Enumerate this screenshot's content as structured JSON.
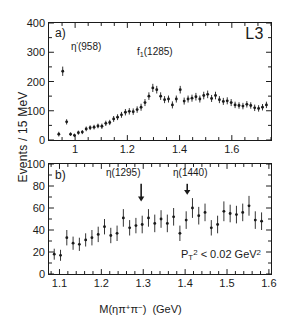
{
  "figure": {
    "experiment": "L3",
    "axis_y_label": "Events / 15 MeV",
    "axis_x_label": "M(ηπ+π−)  (GeV)"
  },
  "panel_a": {
    "tag": "a)",
    "peak_labels": [
      {
        "name": "eta-prime-958",
        "text": "η'(958)"
      },
      {
        "name": "f1-1285",
        "text": "f₁(1285)"
      }
    ]
  },
  "panel_b": {
    "tag": "b)",
    "cut_text": "P T 2 < 0.02 GeV 2",
    "arrow_labels": [
      {
        "name": "eta-1295",
        "text": "η(1295)",
        "x": 1.295
      },
      {
        "name": "eta-1440",
        "text": "η(1440)",
        "x": 1.405
      }
    ]
  },
  "chart_data": [
    {
      "type": "scatter",
      "panel": "a",
      "title": "Events / 15 MeV vs M(ηπ+π−)",
      "xlabel": "M(ηπ+π−)  (GeV)",
      "ylabel": "Events / 15 MeV",
      "xlim": [
        0.9,
        1.75
      ],
      "ylim": [
        0,
        400
      ],
      "xticks": [
        1,
        1.2,
        1.4,
        1.6
      ],
      "xticklabels": [
        "1",
        "1.2",
        "1.4",
        "1.6"
      ],
      "yticks": [
        0,
        100,
        200,
        300,
        400
      ],
      "yticklabels": [
        "0",
        "100",
        "200",
        "300",
        "400"
      ],
      "grid": false,
      "legend": false,
      "x": [
        0.9375,
        0.9525,
        0.9675,
        0.9825,
        0.9975,
        1.0125,
        1.0275,
        1.0425,
        1.0575,
        1.0725,
        1.0875,
        1.1025,
        1.1175,
        1.1325,
        1.1475,
        1.1625,
        1.1775,
        1.1925,
        1.2075,
        1.2225,
        1.2375,
        1.2525,
        1.2675,
        1.2825,
        1.2975,
        1.3125,
        1.3275,
        1.3425,
        1.3575,
        1.3725,
        1.3875,
        1.4025,
        1.4175,
        1.4325,
        1.4475,
        1.4625,
        1.4775,
        1.4925,
        1.5075,
        1.5225,
        1.5375,
        1.5525,
        1.5675,
        1.5825,
        1.5975,
        1.6125,
        1.6275,
        1.6425,
        1.6575,
        1.6725,
        1.6875,
        1.7025,
        1.7175,
        1.7325
      ],
      "y": [
        20,
        235,
        62,
        20,
        16,
        25,
        27,
        38,
        42,
        44,
        48,
        47,
        57,
        60,
        72,
        78,
        86,
        95,
        98,
        97,
        104,
        112,
        128,
        150,
        178,
        172,
        150,
        138,
        140,
        120,
        140,
        172,
        133,
        140,
        143,
        148,
        140,
        152,
        156,
        142,
        152,
        138,
        132,
        134,
        128,
        120,
        118,
        116,
        122,
        118,
        110,
        108,
        112,
        120
      ],
      "yerr": [
        8,
        16,
        9,
        6,
        6,
        7,
        7,
        8,
        8,
        8,
        8,
        9,
        9,
        9,
        10,
        10,
        10,
        11,
        11,
        11,
        11,
        12,
        12,
        13,
        14,
        13,
        13,
        12,
        12,
        12,
        12,
        13,
        12,
        12,
        12,
        13,
        12,
        13,
        13,
        12,
        13,
        12,
        12,
        12,
        12,
        11,
        11,
        11,
        11,
        11,
        11,
        11,
        11,
        11
      ],
      "marker": "filled-circle-with-errorbar",
      "annotations": [
        {
          "text": "η'(958)",
          "x": 0.97,
          "y": 330
        },
        {
          "text": "f₁(1285)",
          "x": 1.27,
          "y": 245
        },
        {
          "text": "L3",
          "x": 1.7,
          "y": 375
        }
      ]
    },
    {
      "type": "scatter",
      "panel": "b",
      "title": "Events / 15 MeV vs M(ηπ+π−), PT2 < 0.02 GeV2",
      "xlabel": "M(ηπ+π−)  (GeV)",
      "ylabel": "Events / 15 MeV",
      "xlim": [
        1.075,
        1.605
      ],
      "ylim": [
        0,
        100
      ],
      "xticks": [
        1.1,
        1.2,
        1.3,
        1.4,
        1.5,
        1.6
      ],
      "xticklabels": [
        "1.1",
        "1.2",
        "1.3",
        "1.4",
        "1.5",
        "1.6"
      ],
      "yticks": [
        0,
        20,
        40,
        60,
        80,
        100
      ],
      "yticklabels": [
        "0",
        "20",
        "40",
        "60",
        "80",
        "100"
      ],
      "grid": false,
      "legend": false,
      "x": [
        1.0875,
        1.1025,
        1.1175,
        1.1325,
        1.1475,
        1.1625,
        1.1775,
        1.1925,
        1.2075,
        1.2225,
        1.2375,
        1.2525,
        1.2675,
        1.2825,
        1.2975,
        1.3125,
        1.3275,
        1.3425,
        1.3575,
        1.3725,
        1.3875,
        1.4025,
        1.4175,
        1.4325,
        1.4475,
        1.4625,
        1.4775,
        1.4925,
        1.5075,
        1.5225,
        1.5375,
        1.5525,
        1.5675,
        1.5825
      ],
      "y": [
        18,
        17,
        33,
        28,
        27,
        31,
        33,
        36,
        43,
        35,
        37,
        51,
        42,
        44,
        45,
        51,
        46,
        50,
        46,
        52,
        37,
        49,
        60,
        53,
        56,
        42,
        45,
        57,
        55,
        54,
        56,
        62,
        49,
        48,
        51
      ],
      "yerr": [
        5,
        5,
        7,
        6,
        6,
        6,
        7,
        7,
        7,
        7,
        7,
        8,
        7,
        7,
        8,
        8,
        8,
        8,
        8,
        8,
        7,
        8,
        9,
        8,
        8,
        7,
        8,
        9,
        8,
        8,
        8,
        9,
        8,
        8
      ],
      "marker": "filled-circle-with-errorbar",
      "annotations": [
        {
          "text": "η(1295)",
          "x": 1.295,
          "y": 92,
          "arrow_to_y": 66
        },
        {
          "text": "η(1440)",
          "x": 1.405,
          "y": 92,
          "arrow_to_y": 72
        },
        {
          "text": "P T 2 < 0.02 GeV 2",
          "x": 1.5,
          "y": 15
        }
      ]
    }
  ]
}
